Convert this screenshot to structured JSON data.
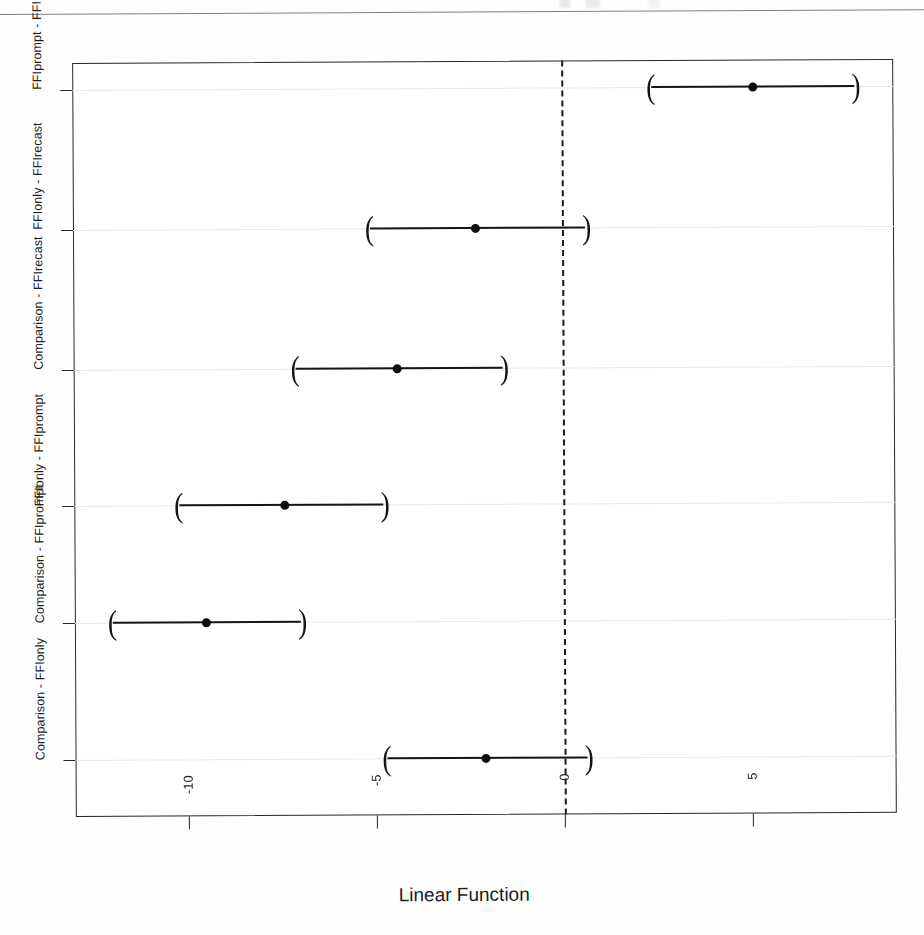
{
  "figure": {
    "x_axis_title": "Linear Function",
    "y_axis_ticks": [
      "FFIprompt - FFIrecast",
      "FFIonly - FFIrecast",
      "Comparison - FFIrecast",
      "FFIonly - FFIprompt",
      "Comparison - FFIprompt",
      "Comparison - FFIonly"
    ],
    "x_axis_ticks": [
      "-10",
      "-5",
      "0",
      "5"
    ],
    "paren_left": "(",
    "paren_right": ")",
    "colors": {
      "ink": "#151515",
      "frame": "#262626",
      "gridline": "#e9e9e9",
      "background": "#ffffff"
    }
  },
  "chart_data": {
    "type": "scatter",
    "plot_style": "confidence-interval-forest-plot",
    "title": "",
    "subtitle": "",
    "xlabel": "Linear Function",
    "ylabel": "",
    "xlim": [
      -12.9,
      8.8
    ],
    "xticks": [
      -10,
      -5,
      0,
      5
    ],
    "grid": true,
    "legend": "none",
    "reference_line": {
      "x": 0,
      "style": "dashed",
      "color": "#1a1a1a"
    },
    "categories": [
      "FFIprompt - FFIrecast",
      "FFIonly - FFIrecast",
      "Comparison - FFIrecast",
      "FFIonly - FFIprompt",
      "Comparison - FFIprompt",
      "Comparison - FFIonly"
    ],
    "estimates": [
      5.1,
      -2.3,
      -4.4,
      -7.4,
      -7.4,
      -2.1
    ],
    "ci_lower": [
      2.4,
      -5.1,
      -7.1,
      -10.2,
      -12.0,
      -4.7
    ],
    "ci_upper": [
      7.8,
      0.6,
      -1.6,
      -4.8,
      -7.0,
      0.6
    ],
    "points": [
      {
        "category": "FFIprompt - FFIrecast",
        "estimate": 5.1,
        "ci_lower": 2.4,
        "ci_upper": 7.8,
        "crosses_zero": false
      },
      {
        "category": "FFIonly - FFIrecast",
        "estimate": -2.3,
        "ci_lower": -5.1,
        "ci_upper": 0.6,
        "crosses_zero": true
      },
      {
        "category": "Comparison - FFIrecast",
        "estimate": -4.4,
        "ci_lower": -7.1,
        "ci_upper": -1.6,
        "crosses_zero": false
      },
      {
        "category": "FFIonly - FFIprompt",
        "estimate": -7.4,
        "ci_lower": -10.2,
        "ci_upper": -4.8,
        "crosses_zero": false
      },
      {
        "category": "Comparison - FFIprompt",
        "estimate": -9.5,
        "ci_lower": -12.0,
        "ci_upper": -7.0,
        "crosses_zero": false
      },
      {
        "category": "Comparison - FFIonly",
        "estimate": -2.1,
        "ci_lower": -4.7,
        "ci_upper": 0.6,
        "crosses_zero": true
      }
    ]
  }
}
